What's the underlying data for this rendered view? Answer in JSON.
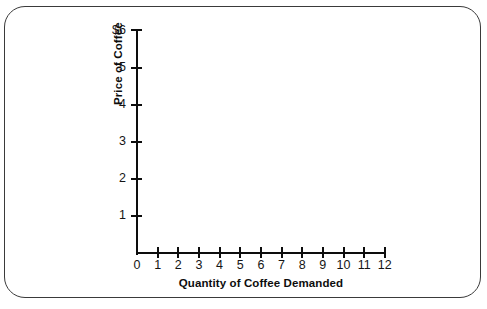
{
  "chart_data": {
    "type": "line",
    "title": "",
    "subtitle": "",
    "xlabel": "Quantity of Coffee Demanded",
    "ylabel": "Price of Coffee",
    "xlim": [
      0,
      12
    ],
    "ylim": [
      0,
      6
    ],
    "xticks": [
      "0",
      "1",
      "2",
      "3",
      "4",
      "5",
      "6",
      "7",
      "8",
      "9",
      "10",
      "11",
      "12"
    ],
    "yticks": [
      "1",
      "2",
      "3",
      "4",
      "5",
      "$6"
    ],
    "ytick_values": [
      1,
      2,
      3,
      4,
      5,
      6
    ],
    "xtick_values": [
      0,
      1,
      2,
      3,
      4,
      5,
      6,
      7,
      8,
      9,
      10,
      11,
      12
    ],
    "grid": false,
    "legend": "none",
    "series": [],
    "annotations": [],
    "note": "Blank axes — no data plotted in the plot area"
  },
  "figure": {
    "border_color": "#3a3a3a",
    "axis_color": "#0d0d0d",
    "background_color": "#ffffff",
    "currency_symbol": "$"
  }
}
